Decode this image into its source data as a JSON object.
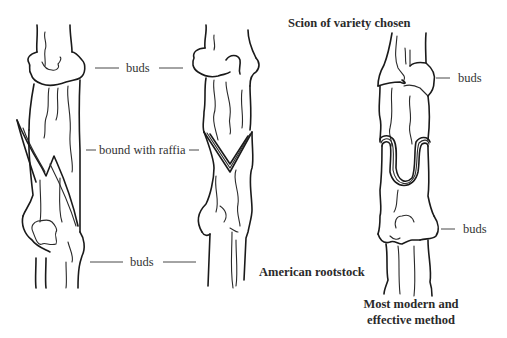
{
  "figure": {
    "panels": [
      {
        "id": "left",
        "description": "Whip graft with long diagonal cut, bound with raffia"
      },
      {
        "id": "middle",
        "description": "Cleft (V-shaped) graft, bound with raffia"
      },
      {
        "id": "right",
        "description": "Omega / U-shaped interlocking graft"
      }
    ]
  },
  "labels": {
    "buds_top": "buds",
    "bound_with_raffia": "bound with raffia",
    "buds_bottom": "buds",
    "scion": "Scion of variety chosen",
    "buds_right_top": "buds",
    "buds_right_bottom": "buds",
    "rootstock": "American rootstock",
    "method_line1": "Most modern and",
    "method_line2": "effective method"
  },
  "colors": {
    "ink": "#1a1a1a",
    "text": "#333333",
    "background": "#ffffff"
  }
}
